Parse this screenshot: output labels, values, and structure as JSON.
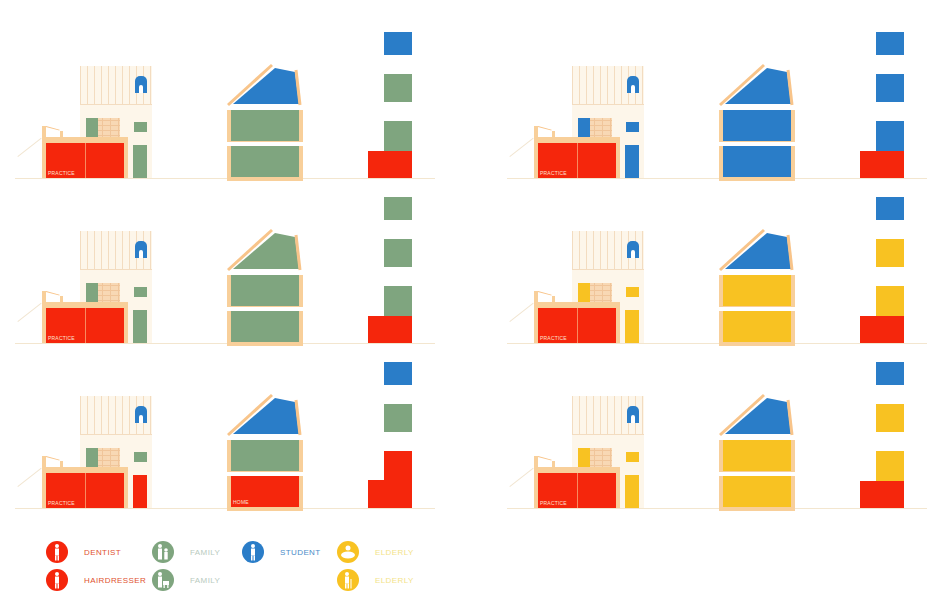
{
  "colors": {
    "dentist": "#f5260c",
    "family": "#7fa57f",
    "student": "#2a7dc8",
    "elderly": "#f8c222",
    "frame": "#f8c48a",
    "pale": "#fdf6ea"
  },
  "scenarios": [
    {
      "row": 1,
      "col": 1,
      "facade_label": "PRACTICE",
      "occupancy": [
        "dentist",
        "family",
        "student"
      ]
    },
    {
      "row": 1,
      "col": 2,
      "facade_label": "PRACTICE",
      "occupancy": [
        "dentist",
        "student",
        "student"
      ]
    },
    {
      "row": 2,
      "col": 1,
      "facade_label": "PRACTICE",
      "occupancy": [
        "dentist",
        "family",
        "family"
      ]
    },
    {
      "row": 2,
      "col": 2,
      "facade_label": "PRACTICE",
      "occupancy": [
        "dentist",
        "elderly",
        "student"
      ]
    },
    {
      "row": 3,
      "col": 1,
      "facade_label": "PRACTICE",
      "section_label": "HOME",
      "occupancy": [
        "hairdresser",
        "family",
        "student"
      ]
    },
    {
      "row": 3,
      "col": 2,
      "facade_label": "PRACTICE",
      "occupancy": [
        "dentist",
        "elderly",
        "student"
      ]
    }
  ],
  "labels": {
    "practice": "PRACTICE",
    "home": "HOME"
  },
  "legend": [
    {
      "label": "DENTIST",
      "icon": "dentist-icon",
      "color": "#f5260c",
      "text_color": "#e0522f"
    },
    {
      "label": "HAIRDRESSER",
      "icon": "hairdresser-icon",
      "color": "#f5260c",
      "text_color": "#e0522f"
    },
    {
      "label": "FAMILY",
      "icon": "family-icon",
      "color": "#7fa57f",
      "text_color": "#b9cbc0"
    },
    {
      "label": "FAMILY",
      "icon": "family-child-icon",
      "color": "#7fa57f",
      "text_color": "#b9cbc0"
    },
    {
      "label": "STUDENT",
      "icon": "student-icon",
      "color": "#2a7dc8",
      "text_color": "#4b8cc8"
    },
    {
      "label": "ELDERLY",
      "icon": "elderly-couple-icon",
      "color": "#f8c222",
      "text_color": "#f3e38a"
    },
    {
      "label": "ELDERLY",
      "icon": "elderly-icon",
      "color": "#f8c222",
      "text_color": "#f3e38a"
    }
  ]
}
